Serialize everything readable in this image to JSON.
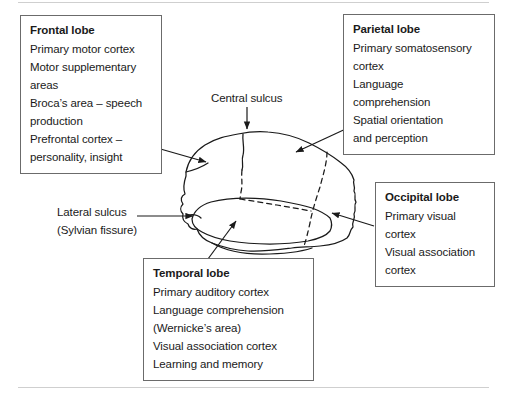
{
  "figure": {
    "type": "brain-lobes-anatomy-diagram",
    "stroke_color": "#1a1a1a",
    "box_border_color": "#6b6b6b",
    "background_color": "#ffffff"
  },
  "boxes": {
    "frontal": {
      "title": "Frontal lobe",
      "lines": [
        "Primary motor cortex",
        "Motor supplementary",
        "areas",
        "Broca’s area – speech",
        "production",
        "Prefrontal cortex –",
        "personality, insight"
      ]
    },
    "parietal": {
      "title": "Parietal lobe",
      "lines": [
        "Primary somatosensory",
        "cortex",
        "Language",
        "comprehension",
        "Spatial orientation",
        "and perception"
      ]
    },
    "occipital": {
      "title": "Occipital lobe",
      "lines": [
        "Primary visual",
        "cortex",
        "Visual association",
        "cortex"
      ]
    },
    "temporal": {
      "title": "Temporal lobe",
      "lines": [
        "Primary auditory cortex",
        "Language comprehension",
        "(Wernicke’s area)",
        "Visual association cortex",
        "Learning and memory"
      ]
    }
  },
  "labels": {
    "central_sulcus": "Central sulcus",
    "lateral_sulcus_line1": "Lateral sulcus",
    "lateral_sulcus_line2": "(Sylvian fissure)"
  },
  "annotations": {
    "arrows": [
      {
        "name": "arrow-central-sulcus",
        "from": "Central sulcus label",
        "to": "top of brain at central sulcus"
      },
      {
        "name": "arrow-frontal-lobe",
        "from": "Frontal lobe box",
        "to": "anterior brain surface"
      },
      {
        "name": "arrow-parietal-lobe",
        "from": "Parietal lobe box",
        "to": "superior-posterior brain surface"
      },
      {
        "name": "arrow-occipital-lobe",
        "from": "Occipital lobe box",
        "to": "posterior brain surface"
      },
      {
        "name": "arrow-temporal-lobe",
        "from": "Temporal lobe box",
        "to": "temporal lobe region"
      },
      {
        "name": "arrow-lateral-sulcus",
        "from": "Lateral sulcus label",
        "to": "lateral sulcus on brain"
      }
    ],
    "dashed_boundaries": [
      "central sulcus boundary between frontal and parietal lobes",
      "boundary between parietal and occipital lobes",
      "superior boundary of the temporal lobe"
    ]
  }
}
